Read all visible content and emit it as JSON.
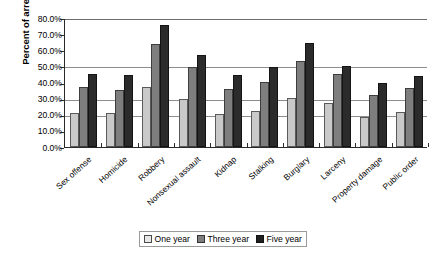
{
  "chart_data": {
    "type": "bar",
    "title": "",
    "xlabel": "",
    "ylabel": "Percent of arrestees",
    "ylim": [
      0,
      80
    ],
    "ytick_labels": [
      "80.0%",
      "70.0%",
      "60.0%",
      "50.0%",
      "40.0%",
      "30.0%",
      "20.0%",
      "10.0%",
      "0.0%"
    ],
    "ytick_values": [
      80,
      70,
      60,
      50,
      40,
      30,
      20,
      10,
      0
    ],
    "gridlines": [
      80,
      50,
      30,
      20
    ],
    "grid": true,
    "legend_position": "bottom",
    "categories": [
      "Sex offense",
      "Homicide",
      "Robbery",
      "Nonsexual assault",
      "Kidnap",
      "Stalking",
      "Burglary",
      "Larceny",
      "Property damage",
      "Public order"
    ],
    "series": [
      {
        "name": "One year",
        "color": "#c9c9c9",
        "values": [
          21.0,
          21.0,
          37.0,
          30.0,
          20.5,
          22.5,
          30.5,
          27.5,
          18.5,
          21.5
        ]
      },
      {
        "name": "Three year",
        "color": "#7e7e7e",
        "values": [
          37.0,
          35.5,
          64.0,
          49.5,
          36.0,
          40.5,
          53.5,
          45.0,
          32.5,
          36.5
        ]
      },
      {
        "name": "Five year",
        "color": "#2b2b2b",
        "values": [
          45.5,
          44.5,
          75.5,
          57.0,
          44.5,
          49.5,
          64.5,
          50.0,
          40.0,
          44.0
        ]
      }
    ]
  },
  "legend": {
    "items": [
      {
        "label": "One year"
      },
      {
        "label": "Three year"
      },
      {
        "label": "Five year"
      }
    ]
  },
  "colors": {
    "series_one_year": "#c9c9c9",
    "series_three_year": "#7e7e7e",
    "series_five_year": "#2b2b2b",
    "axis": "#2a2a2a",
    "gridline": "#8d8d8d",
    "background": "#ffffff"
  }
}
